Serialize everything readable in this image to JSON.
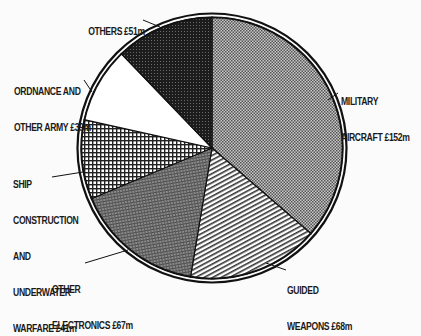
{
  "chart_data": {
    "type": "pie",
    "title": "",
    "currency": "£m",
    "start_angle_deg": 0,
    "direction": "clockwise",
    "slices": [
      {
        "name": "Military aircraft",
        "label_lines": [
          "MILITARY",
          "AIRCRAFT £152m"
        ],
        "value": 152,
        "pattern": "fine-dots",
        "fill": "#9a9a9a"
      },
      {
        "name": "Guided weapons",
        "label_lines": [
          "GUIDED",
          "WEAPONS £68m"
        ],
        "value": 68,
        "pattern": "diagonal-lines",
        "fill": "#ffffff"
      },
      {
        "name": "Other electronics",
        "label_lines": [
          "OTHER",
          "ELECTRONICS £67m"
        ],
        "value": 67,
        "pattern": "dense-crosshatch",
        "fill": "#7a7a7a"
      },
      {
        "name": "Ship construction and underwater warfare",
        "label_lines": [
          "SHIP",
          "CONSTRUCTION",
          "AND",
          "UNDERWATER",
          "WARFARE £41m"
        ],
        "value": 41,
        "pattern": "grid",
        "fill": "#ffffff"
      },
      {
        "name": "Ordnance and other army",
        "label_lines": [
          "ORDNANCE AND",
          "OTHER ARMY £39m"
        ],
        "value": 39,
        "pattern": "none",
        "fill": "#ffffff"
      },
      {
        "name": "Others",
        "label_lines": [
          "OTHERS £51m"
        ],
        "value": 51,
        "pattern": "dark-dots",
        "fill": "#2a2a2a"
      }
    ],
    "total": 418,
    "legend": "none (direct labels with leader lines)"
  },
  "labels": {
    "military": {
      "line1": "MILITARY",
      "line2": "AIRCRAFT £152m"
    },
    "guided": {
      "line1": "GUIDED",
      "line2": "WEAPONS £68m"
    },
    "electronics": {
      "line1": "OTHER",
      "line2": "ELECTRONICS £67m"
    },
    "ship": {
      "line1": "SHIP",
      "line2": "CONSTRUCTION",
      "line3": "AND",
      "line4": "UNDERWATER",
      "line5": "WARFARE £41m"
    },
    "ordnance": {
      "line1": "ORDNANCE AND",
      "line2": "OTHER ARMY £39m"
    },
    "others": {
      "line1": "OTHERS £51m"
    }
  }
}
